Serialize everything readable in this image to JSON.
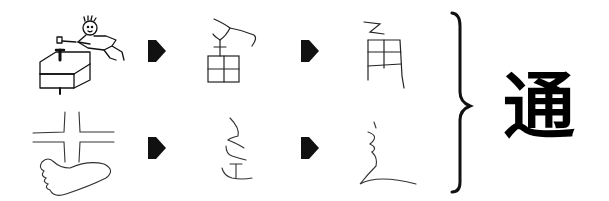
{
  "diagram": {
    "type": "character-etymology",
    "rows": [
      {
        "stages": [
          {
            "kind": "pictograph",
            "description": "child hammering a nail into a box"
          },
          {
            "kind": "early-glyph",
            "description": "nail over grid (用-like form)"
          },
          {
            "kind": "late-glyph",
            "description": "甬 component"
          }
        ]
      },
      {
        "stages": [
          {
            "kind": "pictograph",
            "description": "crossroads over a footprint"
          },
          {
            "kind": "early-glyph",
            "description": "辵 form"
          },
          {
            "kind": "late-glyph",
            "description": "辶 radical"
          }
        ]
      }
    ],
    "arrow_icon": "right-arrow-icon",
    "bracket_icon": "right-curly-brace-icon",
    "result_character": "通"
  }
}
